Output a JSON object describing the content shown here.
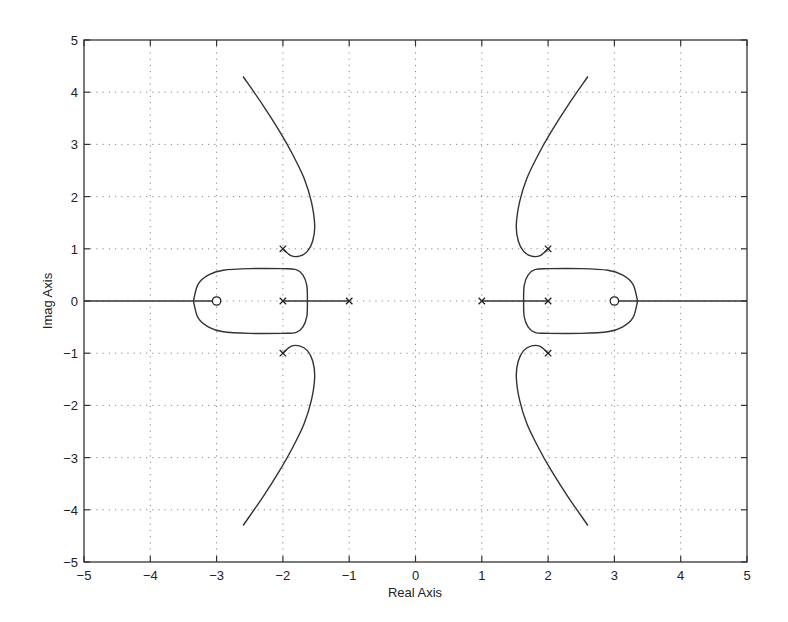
{
  "chart_data": {
    "type": "line",
    "title": "",
    "xlabel": "Real Axis",
    "ylabel": "Imag Axis",
    "xlim": [
      -5,
      5
    ],
    "ylim": [
      -5,
      5
    ],
    "grid": true,
    "legend": null,
    "xticks": [
      -5,
      -4,
      -3,
      -2,
      -1,
      0,
      1,
      2,
      3,
      4,
      5
    ],
    "yticks": [
      -5,
      -4,
      -3,
      -2,
      -1,
      0,
      1,
      2,
      3,
      4,
      5
    ],
    "xtick_labels": [
      "−5",
      "−4",
      "−3",
      "−2",
      "−1",
      "0",
      "1",
      "2",
      "3",
      "4",
      "5"
    ],
    "ytick_labels": [
      "−5",
      "−4",
      "−3",
      "−2",
      "−1",
      "0",
      "1",
      "2",
      "3",
      "4",
      "5"
    ],
    "poles": [
      {
        "re": -2,
        "im": 1
      },
      {
        "re": -2,
        "im": 0
      },
      {
        "re": -2,
        "im": -1
      },
      {
        "re": -1,
        "im": 0
      },
      {
        "re": 1,
        "im": 0
      },
      {
        "re": 2,
        "im": 1
      },
      {
        "re": 2,
        "im": 0
      },
      {
        "re": 2,
        "im": -1
      }
    ],
    "zeros": [
      {
        "re": -3,
        "im": 0
      },
      {
        "re": 3,
        "im": 0
      }
    ],
    "series": [
      {
        "name": "real-axis-left",
        "x": [
          -5,
          -3
        ],
        "y": [
          0,
          0
        ]
      },
      {
        "name": "real-axis-segment-left",
        "x": [
          -2,
          -1
        ],
        "y": [
          0,
          0
        ]
      },
      {
        "name": "real-axis-segment-right",
        "x": [
          1,
          2
        ],
        "y": [
          0,
          0
        ]
      },
      {
        "name": "real-axis-right",
        "x": [
          3,
          5
        ],
        "y": [
          0,
          0
        ]
      },
      {
        "name": "loop-left",
        "x": [
          -3.35,
          -3.28,
          -3.12,
          -2.9,
          -2.5,
          -2.0,
          -1.8,
          -1.7,
          -1.64,
          -1.63,
          -1.64,
          -1.7,
          -1.8,
          -2.0,
          -2.5,
          -2.9,
          -3.12,
          -3.28,
          -3.35
        ],
        "y": [
          0,
          0.32,
          0.5,
          0.59,
          0.62,
          0.62,
          0.6,
          0.5,
          0.3,
          0,
          -0.3,
          -0.5,
          -0.6,
          -0.62,
          -0.62,
          -0.59,
          -0.5,
          -0.32,
          0
        ]
      },
      {
        "name": "loop-right",
        "x": [
          3.35,
          3.28,
          3.12,
          2.9,
          2.5,
          2.0,
          1.8,
          1.7,
          1.64,
          1.63,
          1.64,
          1.7,
          1.8,
          2.0,
          2.5,
          2.9,
          3.12,
          3.28,
          3.35
        ],
        "y": [
          0,
          0.32,
          0.5,
          0.59,
          0.62,
          0.62,
          0.6,
          0.5,
          0.3,
          0,
          -0.3,
          -0.5,
          -0.6,
          -0.62,
          -0.62,
          -0.59,
          -0.5,
          -0.32,
          0
        ]
      },
      {
        "name": "branch-upper-left",
        "x": [
          -2.0,
          -1.88,
          -1.75,
          -1.63,
          -1.55,
          -1.52,
          -1.57,
          -1.68,
          -1.85,
          -2.05,
          -2.3,
          -2.6
        ],
        "y": [
          1.0,
          0.87,
          0.86,
          0.95,
          1.15,
          1.45,
          1.9,
          2.35,
          2.8,
          3.25,
          3.75,
          4.3
        ]
      },
      {
        "name": "branch-lower-left",
        "x": [
          -2.0,
          -1.88,
          -1.75,
          -1.63,
          -1.55,
          -1.52,
          -1.57,
          -1.68,
          -1.85,
          -2.05,
          -2.3,
          -2.6
        ],
        "y": [
          -1.0,
          -0.87,
          -0.86,
          -0.95,
          -1.15,
          -1.45,
          -1.9,
          -2.35,
          -2.8,
          -3.25,
          -3.75,
          -4.3
        ]
      },
      {
        "name": "branch-upper-right",
        "x": [
          2.0,
          1.88,
          1.75,
          1.63,
          1.55,
          1.52,
          1.57,
          1.68,
          1.85,
          2.05,
          2.3,
          2.6
        ],
        "y": [
          1.0,
          0.87,
          0.86,
          0.95,
          1.15,
          1.45,
          1.9,
          2.35,
          2.8,
          3.25,
          3.75,
          4.3
        ]
      },
      {
        "name": "branch-lower-right",
        "x": [
          2.0,
          1.88,
          1.75,
          1.63,
          1.55,
          1.52,
          1.57,
          1.68,
          1.85,
          2.05,
          2.3,
          2.6
        ],
        "y": [
          -1.0,
          -0.87,
          -0.86,
          -0.95,
          -1.15,
          -1.45,
          -1.9,
          -2.35,
          -2.8,
          -3.25,
          -3.75,
          -4.3
        ]
      }
    ]
  },
  "labels": {
    "xlabel": "Real Axis",
    "ylabel": "Imag Axis"
  },
  "colors": {
    "line": "#333333",
    "grid": "#888888",
    "frame": "#333333"
  }
}
